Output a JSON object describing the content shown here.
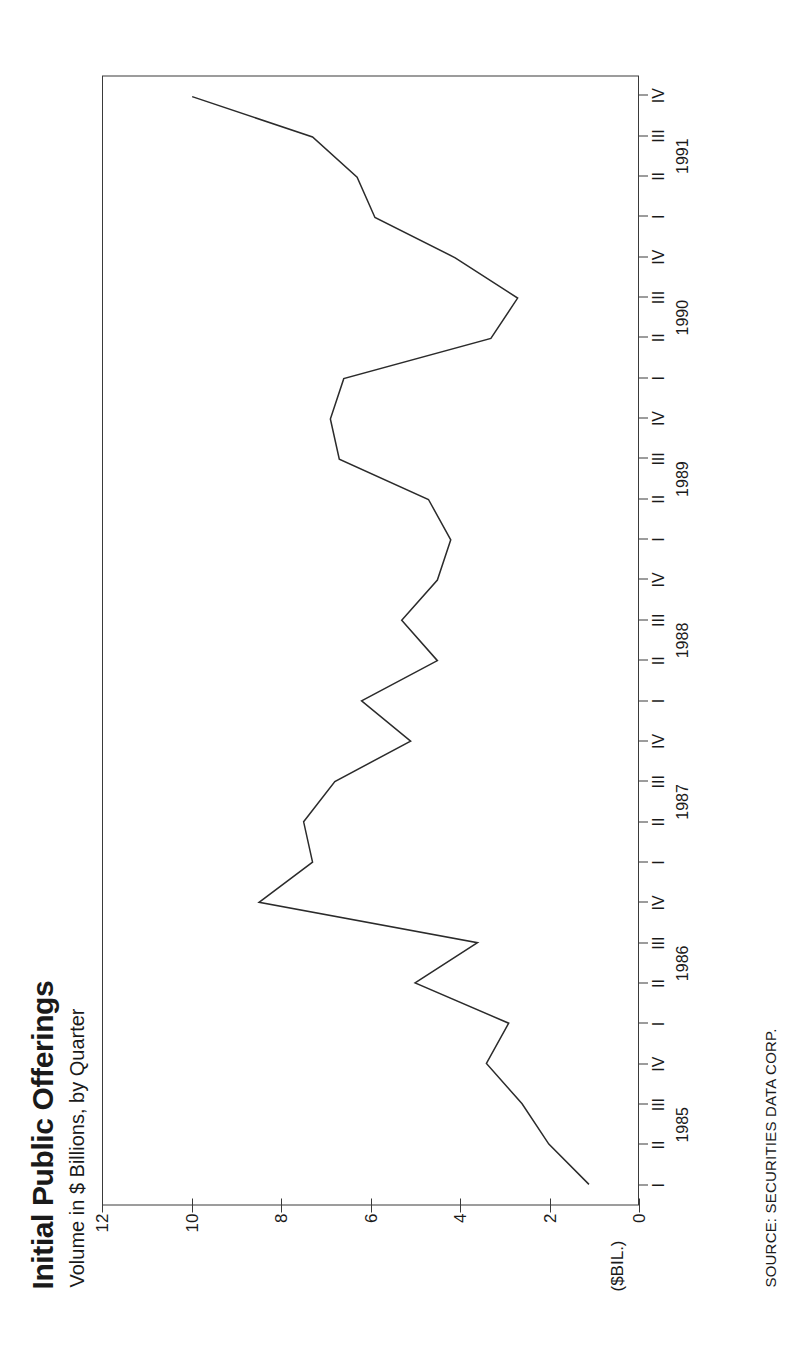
{
  "title": "Initial Public Offerings",
  "subtitle": "Volume in $ Billions, by Quarter",
  "unit_label": "($BIL.)",
  "source": "SOURCE: SECURITIES DATA CORP.",
  "colors": {
    "ink": "#2b2b2b",
    "axis": "#3a3a3a",
    "background": "#ffffff"
  },
  "chart_data": {
    "type": "line",
    "title": "Initial Public Offerings",
    "subtitle": "Volume in $ Billions, by Quarter",
    "xlabel": "",
    "ylabel": "($BIL.)",
    "ylim": [
      0,
      12
    ],
    "yticks": [
      0,
      2,
      4,
      6,
      8,
      10,
      12
    ],
    "ytick_labels": [
      "0",
      "2",
      "4",
      "6",
      "8",
      "10",
      "12"
    ],
    "grid": false,
    "legend": "none",
    "orientation": "rotated-90-ccw",
    "years": [
      "1985",
      "1986",
      "1987",
      "1988",
      "1989",
      "1990",
      "1991"
    ],
    "quarters": [
      "I",
      "II",
      "III",
      "IV"
    ],
    "categories": [
      "1985 I",
      "1985 II",
      "1985 III",
      "1985 IV",
      "1986 I",
      "1986 II",
      "1986 III",
      "1986 IV",
      "1987 I",
      "1987 II",
      "1987 III",
      "1987 IV",
      "1988 I",
      "1988 II",
      "1988 III",
      "1988 IV",
      "1989 I",
      "1989 II",
      "1989 III",
      "1989 IV",
      "1990 I",
      "1990 II",
      "1990 III",
      "1990 IV",
      "1991 I",
      "1991 II",
      "1991 III",
      "1991 IV"
    ],
    "values": [
      1.1,
      2.0,
      2.6,
      3.4,
      2.9,
      5.0,
      3.6,
      8.5,
      7.3,
      7.5,
      6.8,
      5.1,
      6.2,
      4.5,
      5.3,
      4.5,
      4.2,
      4.7,
      6.7,
      6.9,
      6.6,
      3.3,
      2.7,
      4.1,
      5.9,
      6.3,
      7.3,
      10.0
    ],
    "series": [
      {
        "name": "IPO volume",
        "values": [
          1.1,
          2.0,
          2.6,
          3.4,
          2.9,
          5.0,
          3.6,
          8.5,
          7.3,
          7.5,
          6.8,
          5.1,
          6.2,
          4.5,
          5.3,
          4.5,
          4.2,
          4.7,
          6.7,
          6.9,
          6.6,
          3.3,
          2.7,
          4.1,
          5.9,
          6.3,
          7.3,
          10.0
        ]
      }
    ],
    "source": "SOURCE: SECURITIES DATA CORP."
  }
}
